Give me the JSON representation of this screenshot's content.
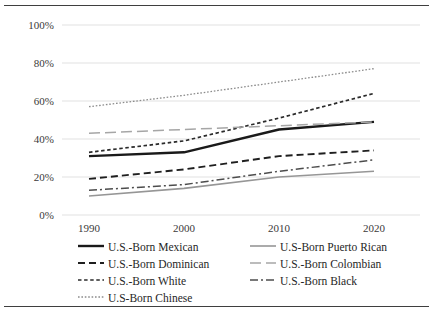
{
  "chart_data": {
    "type": "line",
    "title": "",
    "xlabel": "",
    "ylabel": "",
    "categories": [
      "1990",
      "2000",
      "2010",
      "2020"
    ],
    "x": [
      1990,
      2000,
      2010,
      2020
    ],
    "ylim": [
      0,
      100
    ],
    "ytick_labels": [
      "0%",
      "20%",
      "40%",
      "60%",
      "80%",
      "100%"
    ],
    "ytick_values": [
      0,
      20,
      40,
      60,
      80,
      100
    ],
    "grid": "horizontal",
    "legend_position": "bottom",
    "series": [
      {
        "name": "U.S.-Born Mexican",
        "values": [
          31,
          33,
          45,
          49
        ],
        "style": "solid",
        "color": "#1a1a1a",
        "width": 2.4,
        "dash": ""
      },
      {
        "name": "U.S.-Born Dominican",
        "values": [
          19,
          24,
          31,
          34
        ],
        "style": "dashed",
        "color": "#1f1f1f",
        "width": 1.9,
        "dash": "7,4"
      },
      {
        "name": "U.S.-Born White",
        "values": [
          33,
          39,
          51,
          64
        ],
        "style": "dotted-dash",
        "color": "#2b2b2b",
        "width": 1.7,
        "dash": "3.5,2.6"
      },
      {
        "name": "U.S-Born Chinese",
        "values": [
          57,
          63,
          70,
          77
        ],
        "style": "fine-dotted",
        "color": "#8c8c8c",
        "width": 1.3,
        "dash": "1.6,1.8"
      },
      {
        "name": "U.S-Born Puerto Rican",
        "values": [
          10,
          14,
          20,
          23
        ],
        "style": "solid",
        "color": "#969696",
        "width": 1.6,
        "dash": ""
      },
      {
        "name": "U.S.-Born Colombian",
        "values": [
          43,
          45,
          47,
          49
        ],
        "style": "long-dash",
        "color": "#a6a6a6",
        "width": 1.5,
        "dash": "11,5"
      },
      {
        "name": "U.S.-Born Black",
        "values": [
          13,
          16,
          23,
          29
        ],
        "style": "dash-dot",
        "color": "#4d4d4d",
        "width": 1.5,
        "dash": "8,3,2,3"
      }
    ]
  },
  "legend": {
    "columns": [
      [
        "U.S.-Born Mexican",
        "U.S.-Born Dominican",
        "U.S.-Born White",
        "U.S-Born Chinese"
      ],
      [
        "U.S-Born Puerto Rican",
        "U.S.-Born Colombian",
        "U.S.-Born Black"
      ]
    ]
  },
  "colors": {
    "frame_rule": "#3f3f3f",
    "gridline": "#d9d9d9",
    "text": "#3a3a3a",
    "background": "#ffffff"
  }
}
